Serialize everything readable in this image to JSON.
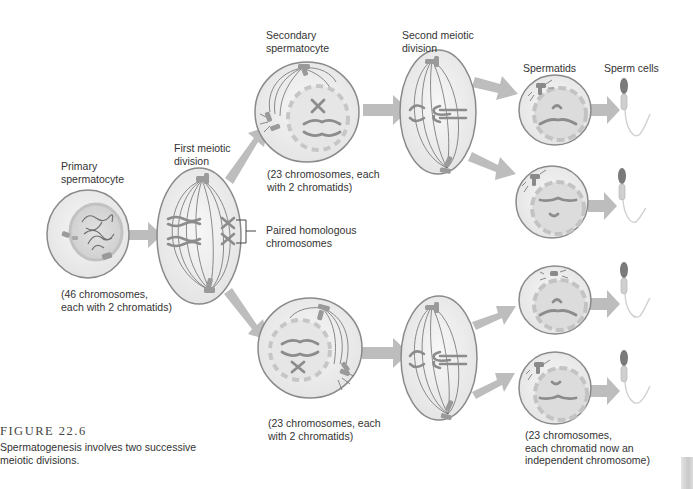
{
  "figure": {
    "number": "FIGURE 22.6",
    "caption": "Spermatogenesis involves two successive meiotic divisions."
  },
  "labels": {
    "primary_title": "Primary\nspermatocyte",
    "primary_note": "(46 chromosomes,\neach with 2 chromatids)",
    "first_div_title": "First meiotic\ndivision",
    "homologous_label": "Paired homologous\nchromosomes",
    "secondary_title": "Secondary\nspermatocyte",
    "secondary_top_note": "(23 chromosomes, each\nwith 2 chromatids)",
    "secondary_bottom_note": "(23 chromosomes, each\nwith 2 chromatids)",
    "second_div_title": "Second meiotic\ndivision",
    "spermatids_title": "Spermatids",
    "sperm_title": "Sperm cells",
    "spermatid_note": "(23 chromosomes,\neach chromatid now an\nindependent chromosome)"
  },
  "colors": {
    "cell_fill": "#efefef",
    "cell_stroke": "#8a8a8a",
    "nucleus": "#d6d6d6",
    "arrow": "#bdbdbd",
    "chromosome": "#8c8c8c",
    "spindle": "#6e6e6e"
  }
}
